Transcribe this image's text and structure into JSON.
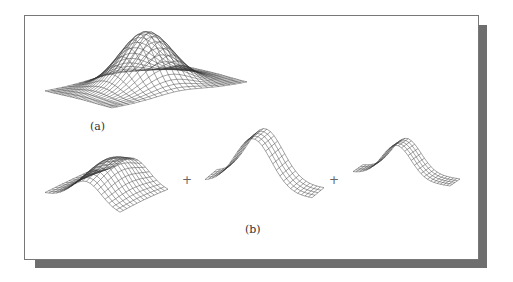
{
  "figure": {
    "labels": {
      "a": "(a)",
      "b": "(b)"
    },
    "operators": [
      "+",
      "+"
    ],
    "panels": [
      {
        "id": "a",
        "description": "2D Gaussian bump wireframe mesh",
        "style": "grid"
      },
      {
        "id": "b1",
        "description": "Gaussian ridge mesh, grid",
        "style": "grid"
      },
      {
        "id": "b2",
        "description": "Gaussian ridge mesh, vertical lines",
        "style": "ridge"
      },
      {
        "id": "b3",
        "description": "Gaussian ridge mesh, vertical lines",
        "style": "ridge"
      }
    ]
  }
}
